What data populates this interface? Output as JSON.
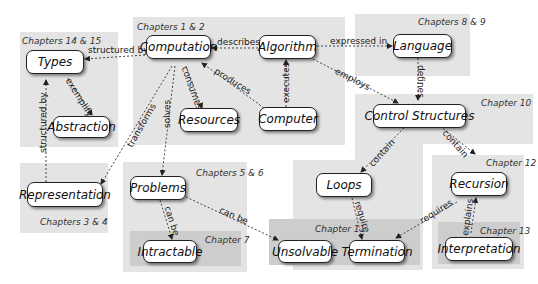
{
  "regions": {
    "ch14_15": "Chapters 14 & 15",
    "ch1_2": "Chapters 1 & 2",
    "ch8_9": "Chapters 8 & 9",
    "ch10": "Chapter 10",
    "ch3_4": "Chapters 3 & 4",
    "ch5_6": "Chapters 5 & 6",
    "ch7": "Chapter 7",
    "ch11": "Chapter 11",
    "ch12": "Chapter 12",
    "ch13": "Chapter 13"
  },
  "nodes": {
    "types": "Types",
    "abstraction": "Abstraction",
    "computation": "Computation",
    "algorithm": "Algorithm",
    "resources": "Resources",
    "computer": "Computer",
    "language": "Language",
    "control_structures": "Control Structures",
    "representation": "Representation",
    "problems": "Problems",
    "intractable": "Intractable",
    "loops": "Loops",
    "unsolvable": "Unsolvable",
    "termination": "Termination",
    "recursion": "Recursion",
    "interpretation": "Interpretation"
  },
  "edges": {
    "structured_by_1": "structured by",
    "exemplify": "exemplify",
    "structured_by_2": "structured by",
    "describes": "describes",
    "expressed_in": "expressed in",
    "consumes": "consumes",
    "produces": "produces",
    "executes": "executes",
    "employs": "employs",
    "defines": "defines",
    "transforms": "transforms",
    "solves": "solves",
    "can_be_1": "can be",
    "can_be_2": "can be",
    "contain_1": "contain",
    "contain_2": "contain",
    "require": "require",
    "requires": "requires",
    "explains": "explains"
  }
}
